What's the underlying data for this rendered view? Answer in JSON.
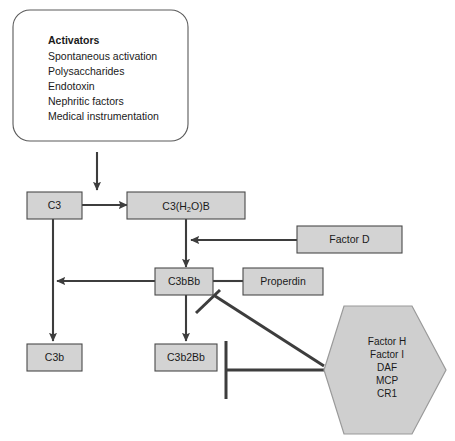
{
  "diagram": {
    "colors": {
      "node_fill": "#d3d3d3",
      "node_stroke": "#4a4a4a",
      "hex_fill": "#cfcfcf",
      "hex_stroke": "#9a9a9a",
      "panel_fill": "#ffffff",
      "panel_stroke": "#5a5a5a",
      "edge": "#3d3d3d",
      "background": "#ffffff"
    },
    "activators_panel": {
      "heading": "Activators",
      "items": [
        "Spontaneous activation",
        "Polysaccharides",
        "Endotoxin",
        "Nephritic factors",
        "Medical instrumentation"
      ]
    },
    "nodes": {
      "c3": "C3",
      "c3h2ob_pre": "C3(H",
      "c3h2ob_sub": "2",
      "c3h2ob_post": "O)B",
      "c3h2ob_full": "C3(H2O)B",
      "c3bbb": "C3bBb",
      "factor_d": "Factor D",
      "properdin": "Properdin",
      "c3b": "C3b",
      "c3b2bb": "C3b2Bb"
    },
    "regulators_hexagon": {
      "items": [
        "Factor H",
        "Factor I",
        "DAF",
        "MCP",
        "CR1"
      ]
    }
  }
}
